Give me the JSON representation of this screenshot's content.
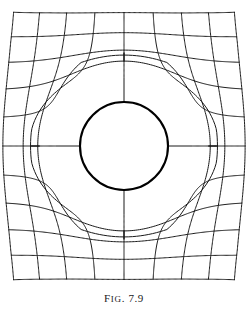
{
  "figure": {
    "caption_prefix": "F",
    "caption_smallcaps": "IG",
    "caption_suffix": ". 7.9",
    "caption_full": "FIG. 7.9",
    "number": "7.9",
    "title": "Fig. 7.9",
    "colors": {
      "background": "#ffffff",
      "grid_line": "#1a1a1a",
      "hole_outline": "#000000",
      "hole_fill": "#ffffff",
      "caption_text": "#1a1a1a"
    }
  },
  "chart_data": {
    "type": "line",
    "title": "Fig. 7.9",
    "subtitle": "",
    "xlabel": "",
    "ylabel": "",
    "grid": true,
    "legend": "none",
    "annotations": [],
    "plot_area": {
      "x_min": 20,
      "x_max": 228,
      "y_min": 20,
      "y_max": 272
    },
    "hole": {
      "shape": "circle",
      "center_x": 124,
      "center_y": 146,
      "radius": 44,
      "stroke_width": 2.1,
      "fill": "#ffffff"
    },
    "grid_spec": {
      "vertical_line_count": 9,
      "horizontal_line_count": 11,
      "vertical_x": [
        20,
        46,
        72,
        98,
        124,
        150,
        176,
        202,
        228
      ],
      "horizontal_y": [
        20,
        45.2,
        70.4,
        95.6,
        120.8,
        146,
        171.2,
        196.4,
        221.6,
        246.8,
        272
      ],
      "stroke_width": 1.0,
      "sample_steps": 190
    },
    "distortion": {
      "model": "radial-dipole-displacement",
      "strength": 1.0,
      "falloff_exponent": 2.0,
      "global_bow_amplitude": 9,
      "description": "Grid points are pushed radially outward from the hole center with a 1/r^2 falloff, plus a gentle global vertical bow; lines terminate on the hole boundary."
    }
  }
}
